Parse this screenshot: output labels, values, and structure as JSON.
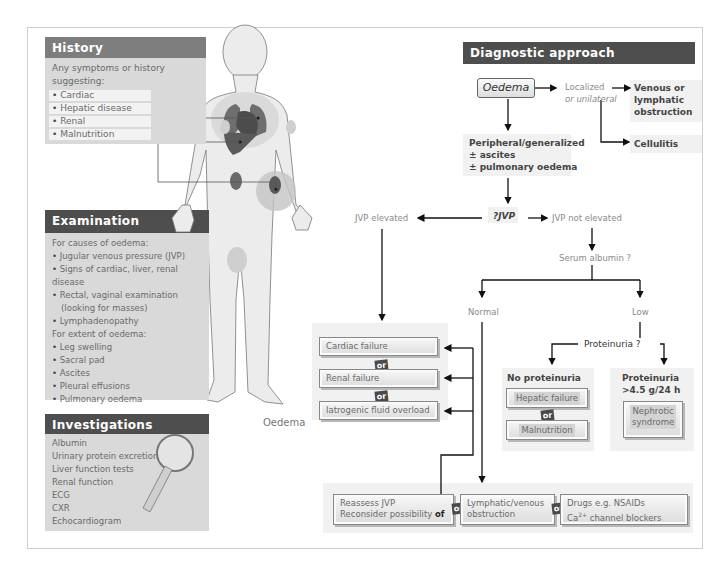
{
  "colors": {
    "history_header": "#7d7d7d",
    "dark_header": "#4e4e4e",
    "panel_body": "#d9d9d9",
    "box_bg": "#f1f1f1",
    "line": "#222222"
  },
  "history": {
    "title": "History",
    "intro": "Any symptoms or history suggesting:",
    "items": [
      "Cardiac",
      "Hepatic disease",
      "Renal",
      "Malnutrition"
    ]
  },
  "examination": {
    "title": "Examination",
    "causes_heading": "For causes of oedema:",
    "causes": [
      "Jugular venous pressure (JVP)",
      "Signs of cardiac, liver, renal disease",
      "Rectal, vaginal examination",
      "(looking for masses)",
      "Lymphadenopathy"
    ],
    "extent_heading": "For extent of oedema:",
    "extent": [
      "Leg swelling",
      "Sacral pad",
      "Ascites",
      "Pleural effusions",
      "Pulmonary oedema"
    ]
  },
  "investigations": {
    "title": "Investigations",
    "items": [
      "Albumin",
      "Urinary protein excretion",
      "Liver function tests",
      "Renal function",
      "ECG",
      "CXR",
      "Echocardiogram"
    ]
  },
  "figure": {
    "oedema_label": "Oedema"
  },
  "diagnostic": {
    "title": "Diagnostic approach",
    "start": "Oedema",
    "localized": "Localized or unilateral",
    "localized_l1": "Localized",
    "localized_l2": "or unilateral",
    "venous": [
      "Venous or",
      "lymphatic",
      "obstruction"
    ],
    "cellulitis": "Cellulitis",
    "generalized": [
      "Peripheral/generalized",
      "± ascites",
      "± pulmonary oedema"
    ],
    "jvp_q": "?JVP",
    "jvp_elevated": "JVP elevated",
    "jvp_not_elevated": "JVP not elevated",
    "serum_albumin": "Serum albumin ?",
    "normal": "Normal",
    "low": "Low",
    "proteinuria_q": "Proteinuria ?",
    "no_proteinuria": "No proteinuria",
    "proteinuria_high": [
      "Proteinuria",
      ">4.5 g/24 h"
    ],
    "elevated_outcomes": [
      "Cardiac failure",
      "Renal failure",
      "Iatrogenic fluid overload"
    ],
    "no_prot_outcomes": [
      "Hepatic failure",
      "Malnutrition"
    ],
    "nephrotic": [
      "Nephrotic",
      "syndrome"
    ],
    "or": "or",
    "bottom": {
      "reassess": [
        "Reassess JVP",
        "Reconsider possibility "
      ],
      "reassess_of": "of",
      "lymphatic": [
        "Lymphatic/venous",
        "obstruction"
      ],
      "drugs_l1": "Drugs e.g. NSAIDs",
      "drugs_ca": "Ca",
      "drugs_sup": "2+",
      "drugs_rest": " channel blockers"
    }
  }
}
